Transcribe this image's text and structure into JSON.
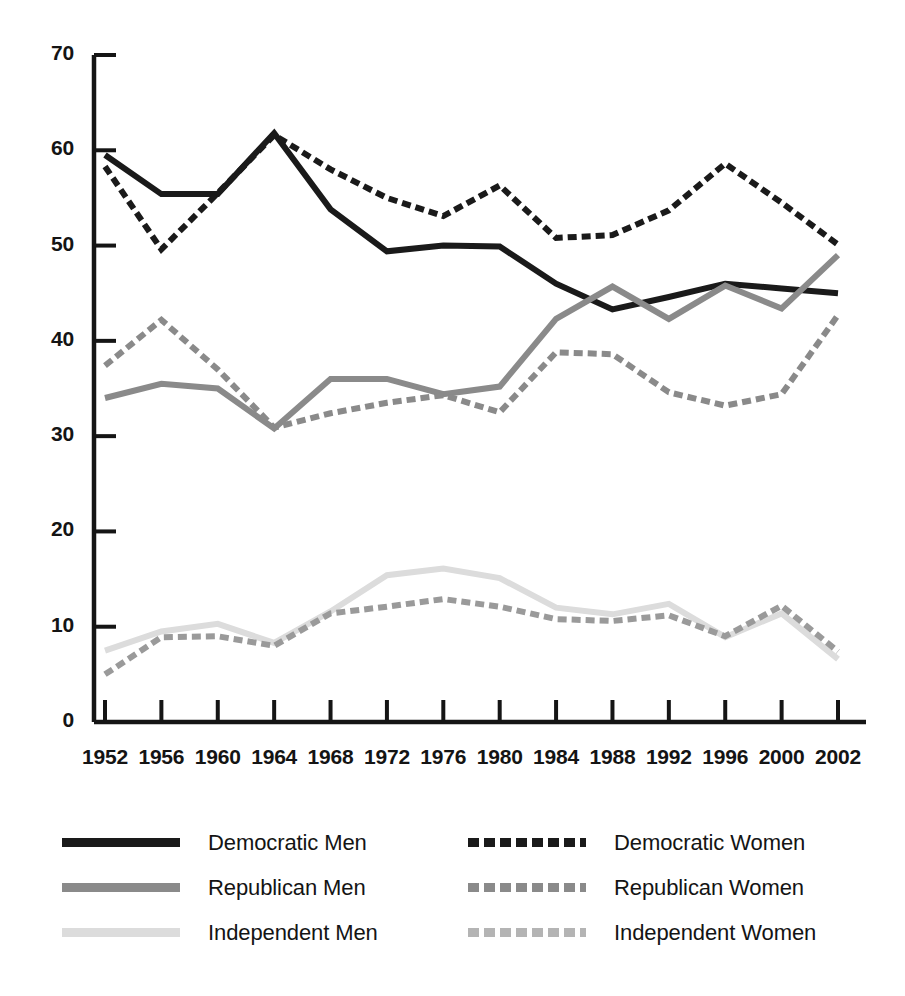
{
  "chart_data": {
    "type": "line",
    "title": "",
    "subtitle": "",
    "xlabel": "",
    "ylabel": "",
    "categories": [
      "1952",
      "1956",
      "1960",
      "1964",
      "1968",
      "1972",
      "1976",
      "1980",
      "1984",
      "1988",
      "1992",
      "1996",
      "2000",
      "2002"
    ],
    "x": [
      1952,
      1956,
      1960,
      1964,
      1968,
      1972,
      1976,
      1980,
      1984,
      1988,
      1992,
      1996,
      2000,
      2002
    ],
    "ylim": [
      0,
      70
    ],
    "yticks": [
      0,
      10,
      20,
      30,
      40,
      50,
      60,
      70
    ],
    "ytick_labels": [
      "0",
      "10",
      "20",
      "30",
      "40",
      "50",
      "60",
      "70"
    ],
    "grid": false,
    "legend_position": "below-plot-two-columns",
    "series": [
      {
        "name": "Democratic Men",
        "color": "#1a1a1a",
        "style": "solid",
        "values": [
          59.5,
          55.4,
          55.4,
          61.8,
          53.8,
          49.4,
          50.0,
          49.9,
          46.0,
          43.3,
          44.6,
          46.0,
          45.5,
          45.0
        ]
      },
      {
        "name": "Democratic Women",
        "color": "#1a1a1a",
        "style": "dashed",
        "values": [
          58.3,
          49.6,
          55.5,
          61.6,
          58.0,
          55.0,
          53.1,
          56.3,
          50.8,
          51.1,
          53.7,
          58.6,
          54.5,
          50.1
        ]
      },
      {
        "name": "Republican Men",
        "color": "#8a8a8a",
        "style": "solid",
        "values": [
          34.0,
          35.5,
          35.0,
          30.8,
          36.0,
          36.0,
          34.4,
          35.2,
          42.3,
          45.7,
          42.3,
          45.8,
          43.4,
          49.0
        ]
      },
      {
        "name": "Republican Women",
        "color": "#8a8a8a",
        "style": "dashed",
        "values": [
          37.4,
          42.2,
          37.0,
          30.9,
          32.4,
          33.5,
          34.3,
          32.5,
          38.8,
          38.6,
          34.6,
          33.2,
          34.4,
          42.7
        ]
      },
      {
        "name": "Independent Men",
        "color": "#dcdcdc",
        "style": "solid",
        "values": [
          7.5,
          9.5,
          10.3,
          8.3,
          11.6,
          15.4,
          16.1,
          15.1,
          12.0,
          11.3,
          12.4,
          8.9,
          11.4,
          6.6
        ]
      },
      {
        "name": "Independent Women",
        "color": "#9a9a9a",
        "style": "dashed",
        "values": [
          5.0,
          8.9,
          9.0,
          8.0,
          11.4,
          12.1,
          12.9,
          12.1,
          10.8,
          10.6,
          11.2,
          9.0,
          12.2,
          7.4
        ]
      }
    ]
  },
  "axes": {
    "y_ticks": [
      "70",
      "60",
      "50",
      "40",
      "30",
      "20",
      "10",
      "0"
    ],
    "x_ticks": [
      "1952",
      "1956",
      "1960",
      "1964",
      "1968",
      "1972",
      "1976",
      "1980",
      "1984",
      "1988",
      "1992",
      "1996",
      "2000",
      "2002"
    ]
  },
  "legend": {
    "columns": [
      {
        "items": [
          {
            "label": "Democratic Men",
            "color": "#1a1a1a",
            "style": "solid"
          },
          {
            "label": "Republican Men",
            "color": "#8a8a8a",
            "style": "solid"
          },
          {
            "label": "Independent Men",
            "color": "#dcdcdc",
            "style": "solid"
          }
        ]
      },
      {
        "items": [
          {
            "label": "Democratic Women",
            "color": "#1a1a1a",
            "style": "dashed"
          },
          {
            "label": "Republican Women",
            "color": "#8a8a8a",
            "style": "dashed"
          },
          {
            "label": "Independent Women",
            "color": "#b4b4b4",
            "style": "dashed"
          }
        ]
      }
    ]
  }
}
